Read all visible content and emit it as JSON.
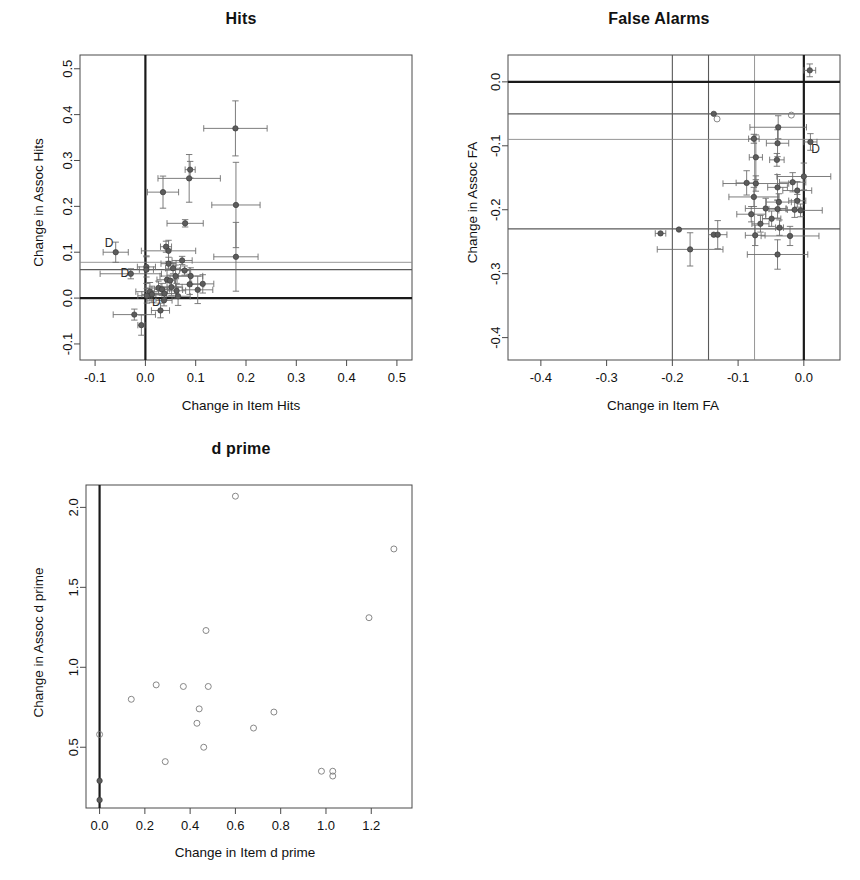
{
  "figure": {
    "width": 860,
    "height": 880,
    "background": "#ffffff",
    "panel_count": 3
  },
  "chart_data": [
    {
      "id": "hits",
      "type": "scatter",
      "title": "Hits",
      "xlabel": "Change in Item Hits",
      "ylabel": "Change in Assoc Hits",
      "xlim": [
        -0.13,
        0.53
      ],
      "ylim": [
        -0.135,
        0.53
      ],
      "xticks": [
        -0.1,
        0.0,
        0.1,
        0.2,
        0.3,
        0.4,
        0.5
      ],
      "xticklabels": [
        "-0.1",
        "0.0",
        "0.1",
        "0.2",
        "0.3",
        "0.4",
        "0.5"
      ],
      "yticks": [
        -0.1,
        0.0,
        0.1,
        0.2,
        0.3,
        0.4,
        0.5
      ],
      "yticklabels": [
        "-0.1",
        "0.0",
        "0.1",
        "0.2",
        "0.3",
        "0.4",
        "0.5"
      ],
      "grid": false,
      "legend": "none",
      "marker": "filled-circle-with-error-bars",
      "reference_lines": {
        "vertical": [
          {
            "x": 0.0,
            "style": "thick-black"
          }
        ],
        "horizontal": [
          {
            "y": 0.0,
            "style": "thick-black"
          },
          {
            "y": 0.078,
            "style": "thin-grey"
          },
          {
            "y": 0.062,
            "style": "medium-grey"
          }
        ]
      },
      "annotations": [
        {
          "text": "D",
          "x": -0.072,
          "y": 0.112
        },
        {
          "text": "D",
          "x": -0.041,
          "y": 0.045
        },
        {
          "text": "D",
          "x": 0.022,
          "y": -0.018
        }
      ],
      "points": [
        {
          "x": 0.179,
          "y": 0.37,
          "xerr": 0.063,
          "yerr": 0.06
        },
        {
          "x": 0.089,
          "y": 0.28,
          "xerr": 0.01,
          "yerr": 0.018
        },
        {
          "x": 0.087,
          "y": 0.261,
          "xerr": 0.062,
          "yerr": 0.052
        },
        {
          "x": 0.035,
          "y": 0.231,
          "xerr": 0.031,
          "yerr": 0.035
        },
        {
          "x": 0.18,
          "y": 0.203,
          "xerr": 0.048,
          "yerr": 0.093
        },
        {
          "x": 0.079,
          "y": 0.163,
          "xerr": 0.036,
          "yerr": 0.008
        },
        {
          "x": 0.041,
          "y": 0.112,
          "xerr": 0.011,
          "yerr": 0.012
        },
        {
          "x": 0.046,
          "y": 0.103,
          "xerr": 0.054,
          "yerr": 0.023
        },
        {
          "x": -0.059,
          "y": 0.1,
          "xerr": 0.025,
          "yerr": 0.022
        },
        {
          "x": 0.18,
          "y": 0.09,
          "xerr": 0.044,
          "yerr": 0.075
        },
        {
          "x": 0.073,
          "y": 0.082,
          "xerr": 0.02,
          "yerr": 0.009
        },
        {
          "x": 0.046,
          "y": 0.075,
          "xerr": 0.015,
          "yerr": 0.014
        },
        {
          "x": 0.002,
          "y": 0.068,
          "xerr": 0.018,
          "yerr": 0.022
        },
        {
          "x": 0.002,
          "y": 0.062,
          "xerr": 0.014,
          "yerr": 0.03
        },
        {
          "x": 0.055,
          "y": 0.065,
          "xerr": 0.015,
          "yerr": 0.012
        },
        {
          "x": 0.078,
          "y": 0.06,
          "xerr": 0.01,
          "yerr": 0.01
        },
        {
          "x": -0.029,
          "y": 0.053,
          "xerr": 0.061,
          "yerr": 0.011
        },
        {
          "x": 0.06,
          "y": 0.048,
          "xerr": 0.031,
          "yerr": 0.024
        },
        {
          "x": 0.09,
          "y": 0.048,
          "xerr": 0.024,
          "yerr": 0.018
        },
        {
          "x": 0.043,
          "y": 0.04,
          "xerr": 0.02,
          "yerr": 0.022
        },
        {
          "x": 0.049,
          "y": 0.038,
          "xerr": 0.009,
          "yerr": 0.012
        },
        {
          "x": 0.114,
          "y": 0.031,
          "xerr": 0.022,
          "yerr": 0.02
        },
        {
          "x": 0.088,
          "y": 0.03,
          "xerr": 0.028,
          "yerr": 0.022
        },
        {
          "x": 0.052,
          "y": 0.024,
          "xerr": 0.021,
          "yerr": 0.018
        },
        {
          "x": 0.026,
          "y": 0.022,
          "xerr": 0.025,
          "yerr": 0.015
        },
        {
          "x": 0.033,
          "y": 0.019,
          "xerr": 0.015,
          "yerr": 0.013
        },
        {
          "x": 0.104,
          "y": 0.018,
          "xerr": 0.03,
          "yerr": 0.03
        },
        {
          "x": 0.062,
          "y": 0.016,
          "xerr": 0.018,
          "yerr": 0.016
        },
        {
          "x": 0.009,
          "y": 0.014,
          "xerr": 0.028,
          "yerr": 0.02
        },
        {
          "x": 0.038,
          "y": 0.01,
          "xerr": 0.022,
          "yerr": 0.014
        },
        {
          "x": 0.013,
          "y": 0.008,
          "xerr": 0.02,
          "yerr": 0.018
        },
        {
          "x": 0.003,
          "y": 0.005,
          "xerr": 0.018,
          "yerr": 0.016
        },
        {
          "x": 0.065,
          "y": 0.004,
          "xerr": 0.024,
          "yerr": 0.02
        },
        {
          "x": 0.037,
          "y": -0.005,
          "xerr": 0.016,
          "yerr": 0.012
        },
        {
          "x": 0.03,
          "y": -0.027,
          "xerr": 0.018,
          "yerr": 0.016
        },
        {
          "x": -0.022,
          "y": -0.036,
          "xerr": 0.042,
          "yerr": 0.012
        },
        {
          "x": -0.008,
          "y": -0.059,
          "xerr": 0.007,
          "yerr": 0.022
        }
      ]
    },
    {
      "id": "false_alarms",
      "type": "scatter",
      "title": "False Alarms",
      "xlabel": "Change in Item FA",
      "ylabel": "Change in Assoc FA",
      "xlim": [
        -0.45,
        0.055
      ],
      "ylim": [
        -0.435,
        0.042
      ],
      "xticks": [
        -0.4,
        -0.3,
        -0.2,
        -0.1,
        0.0
      ],
      "xticklabels": [
        "-0.4",
        "-0.3",
        "-0.2",
        "-0.1",
        "0.0"
      ],
      "yticks": [
        -0.4,
        -0.3,
        -0.2,
        -0.1,
        0.0
      ],
      "yticklabels": [
        "-0.4",
        "-0.3",
        "-0.2",
        "-0.1",
        "0.0"
      ],
      "grid": false,
      "legend": "none",
      "marker": "filled-circle-with-error-bars",
      "reference_lines": {
        "vertical": [
          {
            "x": 0.0,
            "style": "thick-black"
          },
          {
            "x": -0.075,
            "style": "thin-grey"
          },
          {
            "x": -0.145,
            "style": "medium-grey"
          },
          {
            "x": -0.2,
            "style": "medium-grey"
          }
        ],
        "horizontal": [
          {
            "y": 0.0,
            "style": "thick-black"
          },
          {
            "y": -0.05,
            "style": "medium-grey"
          },
          {
            "y": -0.09,
            "style": "thin-grey"
          },
          {
            "y": -0.23,
            "style": "medium-grey"
          }
        ]
      },
      "annotations": [
        {
          "text": "D",
          "x": 0.018,
          "y": -0.112
        }
      ],
      "points": [
        {
          "x": 0.009,
          "y": 0.018,
          "xerr": 0.009,
          "yerr": 0.01,
          "style": "filled"
        },
        {
          "x": -0.137,
          "y": -0.05,
          "xerr": 0.0,
          "yerr": 0.0,
          "style": "filled"
        },
        {
          "x": -0.132,
          "y": -0.058,
          "xerr": 0.0,
          "yerr": 0.0,
          "style": "open"
        },
        {
          "x": -0.019,
          "y": -0.052,
          "xerr": 0.0,
          "yerr": 0.0,
          "style": "open"
        },
        {
          "x": -0.039,
          "y": -0.071,
          "xerr": 0.043,
          "yerr": 0.018,
          "style": "filled"
        },
        {
          "x": -0.076,
          "y": -0.089,
          "xerr": 0.008,
          "yerr": 0.007,
          "style": "filled"
        },
        {
          "x": -0.04,
          "y": -0.096,
          "xerr": 0.017,
          "yerr": 0.021,
          "style": "filled"
        },
        {
          "x": 0.01,
          "y": -0.094,
          "xerr": 0.01,
          "yerr": 0.013,
          "style": "filled"
        },
        {
          "x": -0.073,
          "y": -0.118,
          "xerr": 0.01,
          "yerr": 0.035,
          "style": "filled"
        },
        {
          "x": -0.041,
          "y": -0.122,
          "xerr": 0.011,
          "yerr": 0.01,
          "style": "filled"
        },
        {
          "x": 0.0,
          "y": -0.148,
          "xerr": 0.041,
          "yerr": 0.021,
          "style": "filled"
        },
        {
          "x": -0.087,
          "y": -0.158,
          "xerr": 0.016,
          "yerr": 0.019,
          "style": "filled"
        },
        {
          "x": -0.073,
          "y": -0.159,
          "xerr": 0.05,
          "yerr": 0.012,
          "style": "filled"
        },
        {
          "x": -0.017,
          "y": -0.157,
          "xerr": 0.02,
          "yerr": 0.015,
          "style": "filled"
        },
        {
          "x": -0.04,
          "y": -0.165,
          "xerr": 0.015,
          "yerr": 0.02,
          "style": "filled"
        },
        {
          "x": -0.01,
          "y": -0.17,
          "xerr": 0.022,
          "yerr": 0.014,
          "style": "filled"
        },
        {
          "x": -0.076,
          "y": -0.18,
          "xerr": 0.038,
          "yerr": 0.015,
          "style": "filled"
        },
        {
          "x": -0.038,
          "y": -0.188,
          "xerr": 0.019,
          "yerr": 0.013,
          "style": "filled"
        },
        {
          "x": -0.01,
          "y": -0.186,
          "xerr": 0.013,
          "yerr": 0.01,
          "style": "filled"
        },
        {
          "x": -0.058,
          "y": -0.198,
          "xerr": 0.031,
          "yerr": 0.016,
          "style": "filled"
        },
        {
          "x": -0.04,
          "y": -0.199,
          "xerr": 0.013,
          "yerr": 0.014,
          "style": "filled"
        },
        {
          "x": -0.014,
          "y": -0.2,
          "xerr": 0.011,
          "yerr": 0.012,
          "style": "filled"
        },
        {
          "x": -0.005,
          "y": -0.201,
          "xerr": 0.033,
          "yerr": 0.01,
          "style": "filled"
        },
        {
          "x": -0.08,
          "y": -0.207,
          "xerr": 0.022,
          "yerr": 0.012,
          "style": "filled"
        },
        {
          "x": -0.049,
          "y": -0.214,
          "xerr": 0.014,
          "yerr": 0.012,
          "style": "filled"
        },
        {
          "x": -0.066,
          "y": -0.222,
          "xerr": 0.013,
          "yerr": 0.013,
          "style": "filled"
        },
        {
          "x": -0.037,
          "y": -0.228,
          "xerr": 0.006,
          "yerr": 0.012,
          "style": "filled"
        },
        {
          "x": -0.19,
          "y": -0.231,
          "xerr": 0.0,
          "yerr": 0.0,
          "style": "filled"
        },
        {
          "x": -0.218,
          "y": -0.237,
          "xerr": 0.008,
          "yerr": 0.0,
          "style": "filled"
        },
        {
          "x": -0.137,
          "y": -0.239,
          "xerr": 0.0,
          "yerr": 0.0,
          "style": "filled"
        },
        {
          "x": -0.131,
          "y": -0.239,
          "xerr": 0.014,
          "yerr": 0.022,
          "style": "filled"
        },
        {
          "x": -0.074,
          "y": -0.24,
          "xerr": 0.015,
          "yerr": 0.016,
          "style": "filled"
        },
        {
          "x": -0.021,
          "y": -0.241,
          "xerr": 0.044,
          "yerr": 0.015,
          "style": "filled"
        },
        {
          "x": -0.173,
          "y": -0.262,
          "xerr": 0.05,
          "yerr": 0.026,
          "style": "filled"
        },
        {
          "x": -0.04,
          "y": -0.27,
          "xerr": 0.046,
          "yerr": 0.023,
          "style": "filled"
        }
      ]
    },
    {
      "id": "d_prime",
      "type": "scatter",
      "title": "d prime",
      "xlabel": "Change in Item d prime",
      "ylabel": "Change in Assoc d prime",
      "xlim": [
        -0.06,
        1.38
      ],
      "ylim": [
        0.12,
        2.14
      ],
      "xticks": [
        0.0,
        0.2,
        0.4,
        0.6,
        0.8,
        1.0,
        1.2
      ],
      "xticklabels": [
        "0.0",
        "0.2",
        "0.4",
        "0.6",
        "0.8",
        "1.0",
        "1.2"
      ],
      "yticks": [
        0.5,
        1.0,
        1.5,
        2.0
      ],
      "yticklabels": [
        "0.5",
        "1.0",
        "1.5",
        "2.0"
      ],
      "grid": false,
      "legend": "none",
      "marker": "open-circle",
      "reference_lines": {
        "vertical": [
          {
            "x": 0.0,
            "style": "thick-black"
          }
        ],
        "horizontal": []
      },
      "annotations": [],
      "points": [
        {
          "x": 0.6,
          "y": 2.07,
          "style": "open"
        },
        {
          "x": 1.3,
          "y": 1.74,
          "style": "open"
        },
        {
          "x": 1.19,
          "y": 1.31,
          "style": "open"
        },
        {
          "x": 0.47,
          "y": 1.23,
          "style": "open"
        },
        {
          "x": 0.25,
          "y": 0.89,
          "style": "open"
        },
        {
          "x": 0.37,
          "y": 0.88,
          "style": "open"
        },
        {
          "x": 0.48,
          "y": 0.88,
          "style": "open"
        },
        {
          "x": 0.14,
          "y": 0.8,
          "style": "open"
        },
        {
          "x": 0.44,
          "y": 0.74,
          "style": "open"
        },
        {
          "x": 0.77,
          "y": 0.72,
          "style": "open"
        },
        {
          "x": 0.68,
          "y": 0.62,
          "style": "open"
        },
        {
          "x": 0.43,
          "y": 0.65,
          "style": "open"
        },
        {
          "x": 0.0,
          "y": 0.58,
          "style": "open"
        },
        {
          "x": 0.46,
          "y": 0.5,
          "style": "open"
        },
        {
          "x": 0.29,
          "y": 0.41,
          "style": "open"
        },
        {
          "x": 0.98,
          "y": 0.35,
          "style": "open"
        },
        {
          "x": 1.03,
          "y": 0.35,
          "style": "open"
        },
        {
          "x": 1.03,
          "y": 0.32,
          "style": "open"
        },
        {
          "x": 0.0,
          "y": 0.29,
          "style": "filled"
        },
        {
          "x": 0.0,
          "y": 0.17,
          "style": "filled"
        }
      ]
    }
  ]
}
